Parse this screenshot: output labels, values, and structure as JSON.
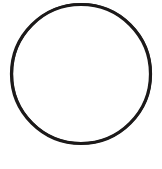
{
  "canvas": {
    "width": 162,
    "height": 169,
    "background_color": "#ffffff",
    "description": "Blank white page containing a single hand-drawn circle outline"
  },
  "figure": {
    "name": "circle-outline",
    "shape_type": "circle",
    "style": "outline",
    "fill": "none",
    "stroke_color": "#1c1a1a",
    "stroke_width": 3.2,
    "center_x": 81,
    "center_y": 74,
    "radius_x": 69.5,
    "radius_y": 69.5,
    "bounds": {
      "left": 11,
      "top": 4,
      "right": 151,
      "bottom": 143
    },
    "appearance": "slightly irregular, scanned ink line",
    "label": ""
  },
  "annotations": {
    "text_present": false,
    "items": []
  }
}
